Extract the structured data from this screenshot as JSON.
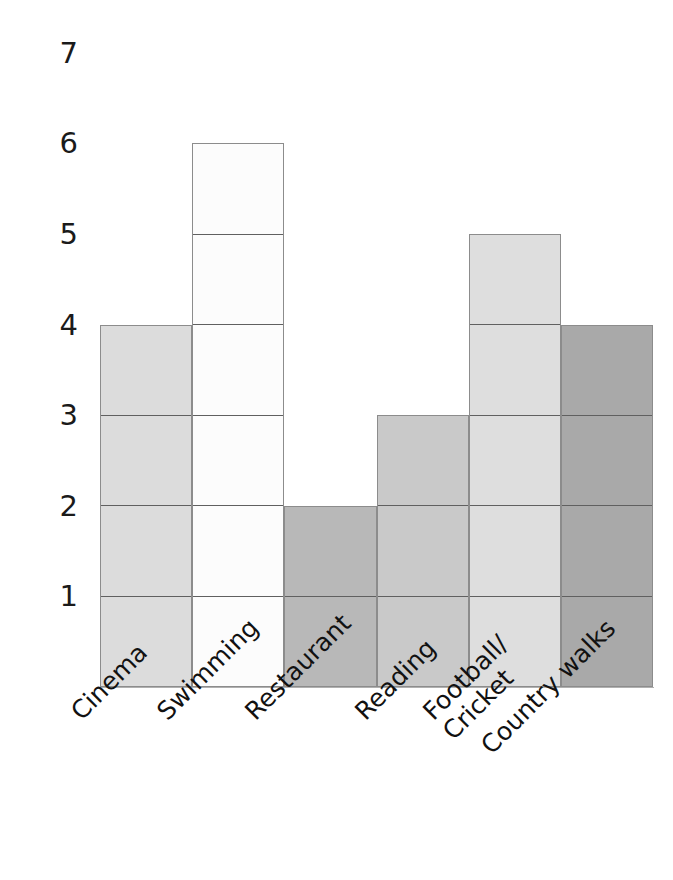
{
  "chart_data": {
    "type": "bar",
    "title": "",
    "subtitle": "",
    "xlabel": "",
    "ylabel": "",
    "categories": [
      "Cinema",
      "Swimming",
      "Restaurant",
      "Reading",
      "Football/\nCricket",
      "Country walks"
    ],
    "values": [
      4,
      6,
      2,
      3,
      5,
      4
    ],
    "ylim": [
      0,
      7
    ],
    "ytick_labels": [
      "7",
      "6",
      "5",
      "4",
      "3",
      "2",
      "1"
    ],
    "ytick_values": [
      7,
      6,
      5,
      4,
      3,
      2,
      1
    ],
    "grid": false,
    "legend": "none",
    "bar_colors": [
      "#dcdcdc",
      "#fcfcfc",
      "#b8b8b8",
      "#c9c9c9",
      "#dedede",
      "#a9a9a9"
    ],
    "bar_border_color": "#8c8c8c",
    "segment_divider_color": "#606060"
  },
  "axis": {
    "y_ticks": [
      {
        "label": "7",
        "value": 7
      },
      {
        "label": "6",
        "value": 6
      },
      {
        "label": "5",
        "value": 5
      },
      {
        "label": "4",
        "value": 4
      },
      {
        "label": "3",
        "value": 3
      },
      {
        "label": "2",
        "value": 2
      },
      {
        "label": "1",
        "value": 1
      }
    ]
  },
  "bars": [
    {
      "label": "Cinema",
      "value": 4,
      "color": "#dcdcdc"
    },
    {
      "label": "Swimming",
      "value": 6,
      "color": "#fcfcfc"
    },
    {
      "label": "Restaurant",
      "value": 2,
      "color": "#b8b8b8"
    },
    {
      "label": "Reading",
      "value": 3,
      "color": "#c9c9c9"
    },
    {
      "label": "Football/\nCricket",
      "value": 5,
      "color": "#dedede"
    },
    {
      "label": "Country walks",
      "value": 4,
      "color": "#a9a9a9"
    }
  ]
}
